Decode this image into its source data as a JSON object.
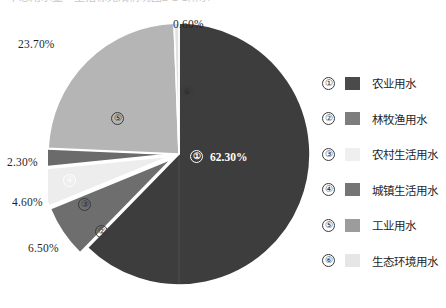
{
  "top_caption": "中总用水量一里指标完成情况图2-1-1所示",
  "chart_data": {
    "type": "pie",
    "title": "",
    "legend_position": "right",
    "start_angle_deg": 0,
    "direction": "clockwise",
    "categories": [
      "农业用水",
      "林牧渔用水",
      "农村生活用水",
      "城镇生活用水",
      "工业用水",
      "生态环境用水"
    ],
    "values": [
      62.3,
      6.5,
      4.6,
      2.3,
      23.7,
      0.6
    ],
    "value_labels": [
      "62.30%",
      "6.50%",
      "4.60%",
      "2.30%",
      "23.70%",
      "0.60%"
    ],
    "index_labels": [
      "①",
      "②",
      "③",
      "④",
      "⑤",
      "⑥"
    ],
    "colors": [
      "#3d3d3d",
      "#6e6e6e",
      "#ededed",
      "#6b6b6b",
      "#b5b5b5",
      "#e2e2e2"
    ],
    "exploded": [
      false,
      true,
      true,
      true,
      false,
      false
    ],
    "slices": [
      {
        "index": "①",
        "label": "农业用水",
        "value": 62.3,
        "value_label": "62.30%",
        "color": "#3d3d3d"
      },
      {
        "index": "②",
        "label": "林牧渔用水",
        "value": 6.5,
        "value_label": "6.50%",
        "color": "#6e6e6e"
      },
      {
        "index": "③",
        "label": "农村生活用水",
        "value": 4.6,
        "value_label": "4.60%",
        "color": "#ededed"
      },
      {
        "index": "④",
        "label": "城镇生活用水",
        "value": 2.3,
        "value_label": "2.30%",
        "color": "#6b6b6b"
      },
      {
        "index": "⑤",
        "label": "工业用水",
        "value": 23.7,
        "value_label": "23.70%",
        "color": "#b5b5b5"
      },
      {
        "index": "⑥",
        "label": "生态环境用水",
        "value": 0.6,
        "value_label": "0.60%",
        "color": "#e2e2e2"
      }
    ]
  },
  "legend": {
    "items": [
      {
        "index": "①",
        "label": "农业用水",
        "color": "#4a4a4a"
      },
      {
        "index": "②",
        "label": "林牧渔用水",
        "color": "#7d7d7d"
      },
      {
        "index": "③",
        "label": "农村生活用水",
        "color": "#efefef"
      },
      {
        "index": "④",
        "label": "城镇生活用水",
        "color": "#757575"
      },
      {
        "index": "⑤",
        "label": "工业用水",
        "color": "#9c9c9c"
      },
      {
        "index": "⑥",
        "label": "生态环境用水",
        "color": "#e6e6e6"
      }
    ]
  }
}
